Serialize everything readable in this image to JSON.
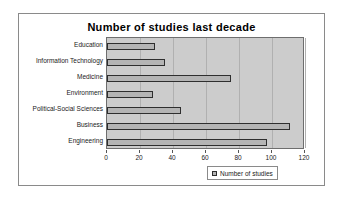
{
  "chart_data": {
    "type": "bar",
    "orientation": "horizontal",
    "title": "Number of studies last decade",
    "xlabel": "",
    "ylabel": "",
    "categories": [
      "Education",
      "Information Technology",
      "Medicine",
      "Environment",
      "Political-Social Sciences",
      "Business",
      "Engineering"
    ],
    "values": [
      29,
      35,
      75,
      28,
      45,
      111,
      97
    ],
    "series": [
      {
        "name": "Number of studies",
        "values": [
          29,
          35,
          75,
          28,
          45,
          111,
          97
        ]
      }
    ],
    "xlim": [
      0,
      120
    ],
    "xticks": [
      0,
      20,
      40,
      60,
      80,
      100,
      120
    ],
    "xtick_labels": [
      "0",
      "20",
      "40",
      "60",
      "80",
      "100",
      "120"
    ],
    "grid": true,
    "grid_axis": "x",
    "legend": {
      "position": "bottom-right",
      "entries": [
        "Number of studies"
      ]
    },
    "colors": {
      "bar_fill": "#b4b4b4",
      "bar_border": "#2e2e2e",
      "plot_background": "#cccccc",
      "chart_background": "#ffffff",
      "gridline": "#b0b0b0",
      "text": "#1a1a1a"
    }
  }
}
